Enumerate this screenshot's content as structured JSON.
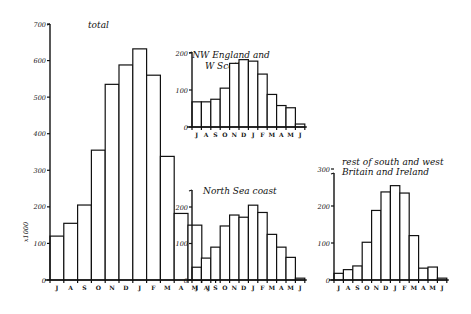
{
  "figure": {
    "y_axis_label": "x1000",
    "month_labels": [
      "J",
      "A",
      "S",
      "O",
      "N",
      "D",
      "J",
      "F",
      "M",
      "A",
      "M",
      "J"
    ]
  },
  "chart_data": [
    {
      "type": "bar",
      "title": "total",
      "xlabel": "",
      "ylabel": "x1000",
      "categories": [
        "J",
        "A",
        "S",
        "O",
        "N",
        "D",
        "J",
        "F",
        "M",
        "A",
        "M",
        "J"
      ],
      "values": [
        120,
        155,
        205,
        355,
        535,
        588,
        632,
        560,
        338,
        182,
        150,
        8
      ],
      "yticks": [
        0,
        100,
        200,
        300,
        400,
        500,
        600,
        700
      ],
      "ylim": [
        0,
        700
      ],
      "grid": false
    },
    {
      "type": "bar",
      "title": "NW England and W Scotland",
      "title_lines": [
        "NW England and",
        "W Scotland"
      ],
      "xlabel": "",
      "ylabel": "",
      "categories": [
        "J",
        "A",
        "S",
        "O",
        "N",
        "D",
        "J",
        "F",
        "M",
        "A",
        "M",
        "J"
      ],
      "values": [
        68,
        68,
        75,
        105,
        172,
        182,
        178,
        143,
        88,
        58,
        52,
        8
      ],
      "yticks": [
        0,
        100,
        200
      ],
      "ylim": [
        0,
        200
      ],
      "grid": false
    },
    {
      "type": "bar",
      "title": "North Sea coast",
      "title_lines": [
        "North Sea coast"
      ],
      "xlabel": "",
      "ylabel": "",
      "categories": [
        "J",
        "A",
        "S",
        "O",
        "N",
        "D",
        "J",
        "F",
        "M",
        "A",
        "M",
        "J"
      ],
      "values": [
        35,
        60,
        90,
        148,
        178,
        172,
        205,
        185,
        125,
        90,
        62,
        5
      ],
      "yticks": [
        0,
        100,
        200
      ],
      "ylim": [
        0,
        250
      ],
      "grid": false
    },
    {
      "type": "bar",
      "title": "rest of south and west Britain and Ireland",
      "title_lines": [
        "rest of south and west",
        "Britain and Ireland"
      ],
      "xlabel": "",
      "ylabel": "",
      "categories": [
        "J",
        "A",
        "S",
        "O",
        "N",
        "D",
        "J",
        "F",
        "M",
        "A",
        "M",
        "J"
      ],
      "values": [
        18,
        28,
        38,
        102,
        188,
        238,
        255,
        235,
        120,
        32,
        35,
        5
      ],
      "yticks": [
        0,
        100,
        200,
        300
      ],
      "ylim": [
        0,
        300
      ],
      "grid": false
    }
  ]
}
